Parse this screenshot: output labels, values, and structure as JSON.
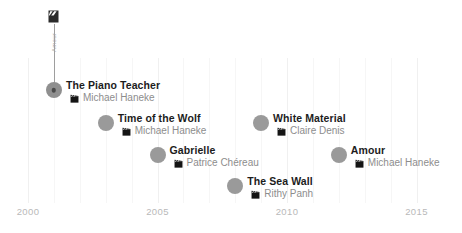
{
  "chart_data": {
    "type": "scatter",
    "title": "",
    "xlabel": "",
    "ylabel": "",
    "xlim": [
      1999,
      2016
    ],
    "grid": true,
    "legend": false,
    "axis_ticks": [
      "2000",
      "2005",
      "2010",
      "2015"
    ],
    "axis_tick_years": [
      2000,
      2005,
      2010,
      2015
    ],
    "minor_gridline_years": [
      2001,
      2002,
      2003,
      2004,
      2006,
      2007,
      2008,
      2009,
      2011,
      2012,
      2013,
      2014
    ],
    "points": [
      {
        "title": "The Piano Teacher",
        "director": "Michael Haneke",
        "year": 2001,
        "row": 0,
        "highlighted": true
      },
      {
        "title": "Time of the Wolf",
        "director": "Michael Haneke",
        "year": 2003,
        "row": 1,
        "highlighted": false
      },
      {
        "title": "White Material",
        "director": "Claire Denis",
        "year": 2009,
        "row": 1,
        "highlighted": false
      },
      {
        "title": "Gabrielle",
        "director": "Patrice Chéreau",
        "year": 2005,
        "row": 2,
        "highlighted": false
      },
      {
        "title": "Amour",
        "director": "Michael Haneke",
        "year": 2012,
        "row": 2,
        "highlighted": false
      },
      {
        "title": "The Sea Wall",
        "director": "Rithy Panh",
        "year": 2008,
        "row": 3,
        "highlighted": false
      }
    ]
  },
  "annotation": {
    "vertical_label": "Amour",
    "icon": "clapperboard-icon"
  },
  "colors": {
    "dot": "#9a9a9a",
    "dot_center": "#4a4a4a",
    "title_text": "#1c1c1c",
    "director_text": "#8d8d8d",
    "axis_text": "#b9b9b9",
    "gridline": "#f0f0f0",
    "leader_line": "#9e9e9e",
    "background": "#ffffff"
  }
}
